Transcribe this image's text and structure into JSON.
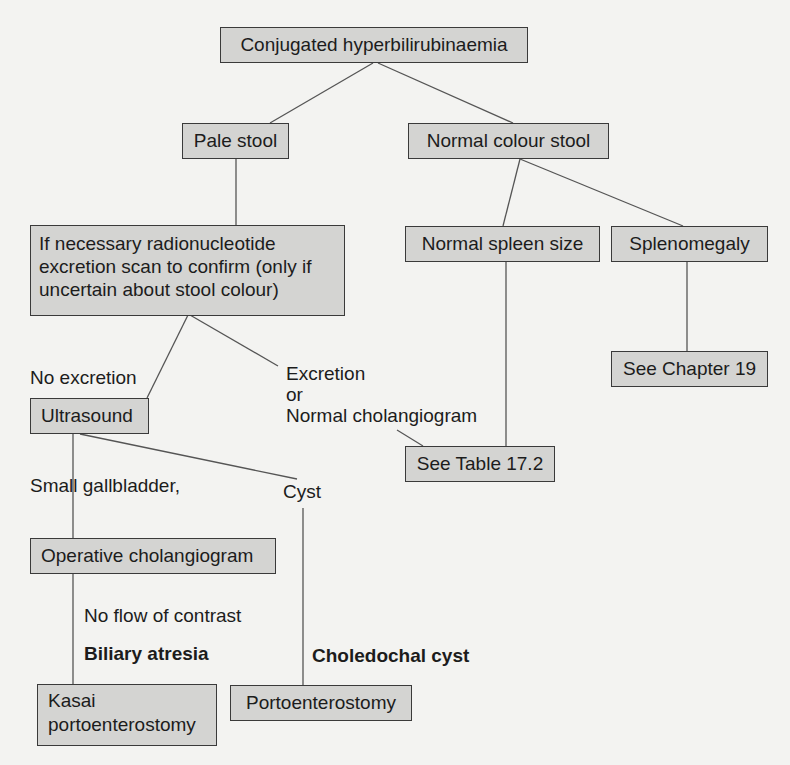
{
  "diagram": {
    "type": "flowchart",
    "nodes": {
      "root": "Conjugated hyperbilirubinaemia",
      "pale_stool": "Pale stool",
      "normal_stool": "Normal colour stool",
      "radionucleotide": "If necessary radionucleotide excretion scan to confirm (only if uncertain about stool colour)",
      "normal_spleen": "Normal spleen size",
      "splenomegaly": "Splenomegaly",
      "see_chapter": "See Chapter 19",
      "ultrasound": "Ultrasound",
      "see_table": "See Table 17.2",
      "operative_cholangiogram": "Operative cholangiogram",
      "kasai": "Kasai portoenterostomy",
      "portoenterostomy": "Portoenterostomy"
    },
    "edge_labels": {
      "no_excretion": "No excretion",
      "excretion_line1": "Excretion",
      "excretion_line2": "or",
      "excretion_line3": "Normal cholangiogram",
      "small_gallbladder": "Small gallbladder,",
      "cyst": "Cyst",
      "no_flow": "No flow of contrast",
      "biliary_atresia": "Biliary atresia",
      "choledochal_cyst": "Choledochal cyst"
    },
    "edges": [
      {
        "from": "root",
        "to": "pale_stool"
      },
      {
        "from": "root",
        "to": "normal_stool"
      },
      {
        "from": "pale_stool",
        "to": "radionucleotide"
      },
      {
        "from": "normal_stool",
        "to": "normal_spleen"
      },
      {
        "from": "normal_stool",
        "to": "splenomegaly"
      },
      {
        "from": "splenomegaly",
        "to": "see_chapter"
      },
      {
        "from": "normal_spleen",
        "to": "see_table"
      },
      {
        "from": "radionucleotide",
        "to": "ultrasound",
        "label": "No excretion"
      },
      {
        "from": "radionucleotide",
        "to": "see_table",
        "label": "Excretion or Normal cholangiogram"
      },
      {
        "from": "ultrasound",
        "to": "operative_cholangiogram",
        "label": "Small gallbladder,"
      },
      {
        "from": "ultrasound",
        "to": "portoenterostomy",
        "label": "Cyst / Choledochal cyst"
      },
      {
        "from": "operative_cholangiogram",
        "to": "kasai",
        "label": "No flow of contrast / Biliary atresia"
      }
    ],
    "colors": {
      "box_fill": "#d4d4d2",
      "box_border": "#3a3a3a",
      "line": "#555555",
      "background": "#f3f3f1"
    }
  }
}
